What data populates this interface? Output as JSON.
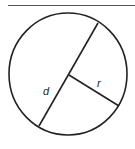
{
  "diagram": {
    "type": "circle",
    "labels": {
      "diameter": "d",
      "radius": "r"
    },
    "colors": {
      "stroke": "#222222",
      "background": "#ffffff"
    }
  }
}
